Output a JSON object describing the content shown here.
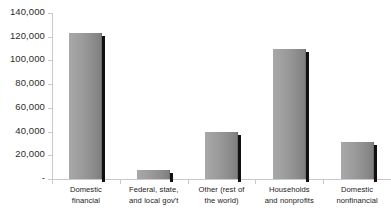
{
  "chart_data": {
    "type": "bar",
    "title": "",
    "subtitle": "",
    "xlabel": "",
    "ylabel": "",
    "categories": [
      "Domestic financial",
      "Federal, state, and local gov't",
      "Other (rest of the world)",
      "Households and nonprofits",
      "Domestic nonfinancial"
    ],
    "category_lines": [
      [
        "Domestic",
        "financial"
      ],
      [
        "Federal, state,",
        "and local gov't"
      ],
      [
        "Other (rest of",
        "the world)"
      ],
      [
        "Households",
        "and nonprofits"
      ],
      [
        "Domestic",
        "nonfinancial"
      ]
    ],
    "values": [
      123000,
      8000,
      40000,
      110000,
      31000
    ],
    "ylim": [
      0,
      140000
    ],
    "yticks": [
      0,
      20000,
      40000,
      60000,
      80000,
      100000,
      120000,
      140000
    ],
    "ytick_labels": [
      "-",
      "20,000",
      "40,000",
      "60,000",
      "80,000",
      "100,000",
      "120,000",
      "140,000"
    ],
    "grid": false,
    "legend": false,
    "series": [
      {
        "name": "",
        "values": [
          123000,
          8000,
          40000,
          110000,
          31000
        ]
      }
    ],
    "colors": {
      "bar_fill_light": "#a8a8a8",
      "bar_fill_dark": "#7e7e7e",
      "bar_shadow": "#111111",
      "axis": "#c9c9c9",
      "text": "#1a1a1a",
      "background": "#ffffff"
    }
  }
}
